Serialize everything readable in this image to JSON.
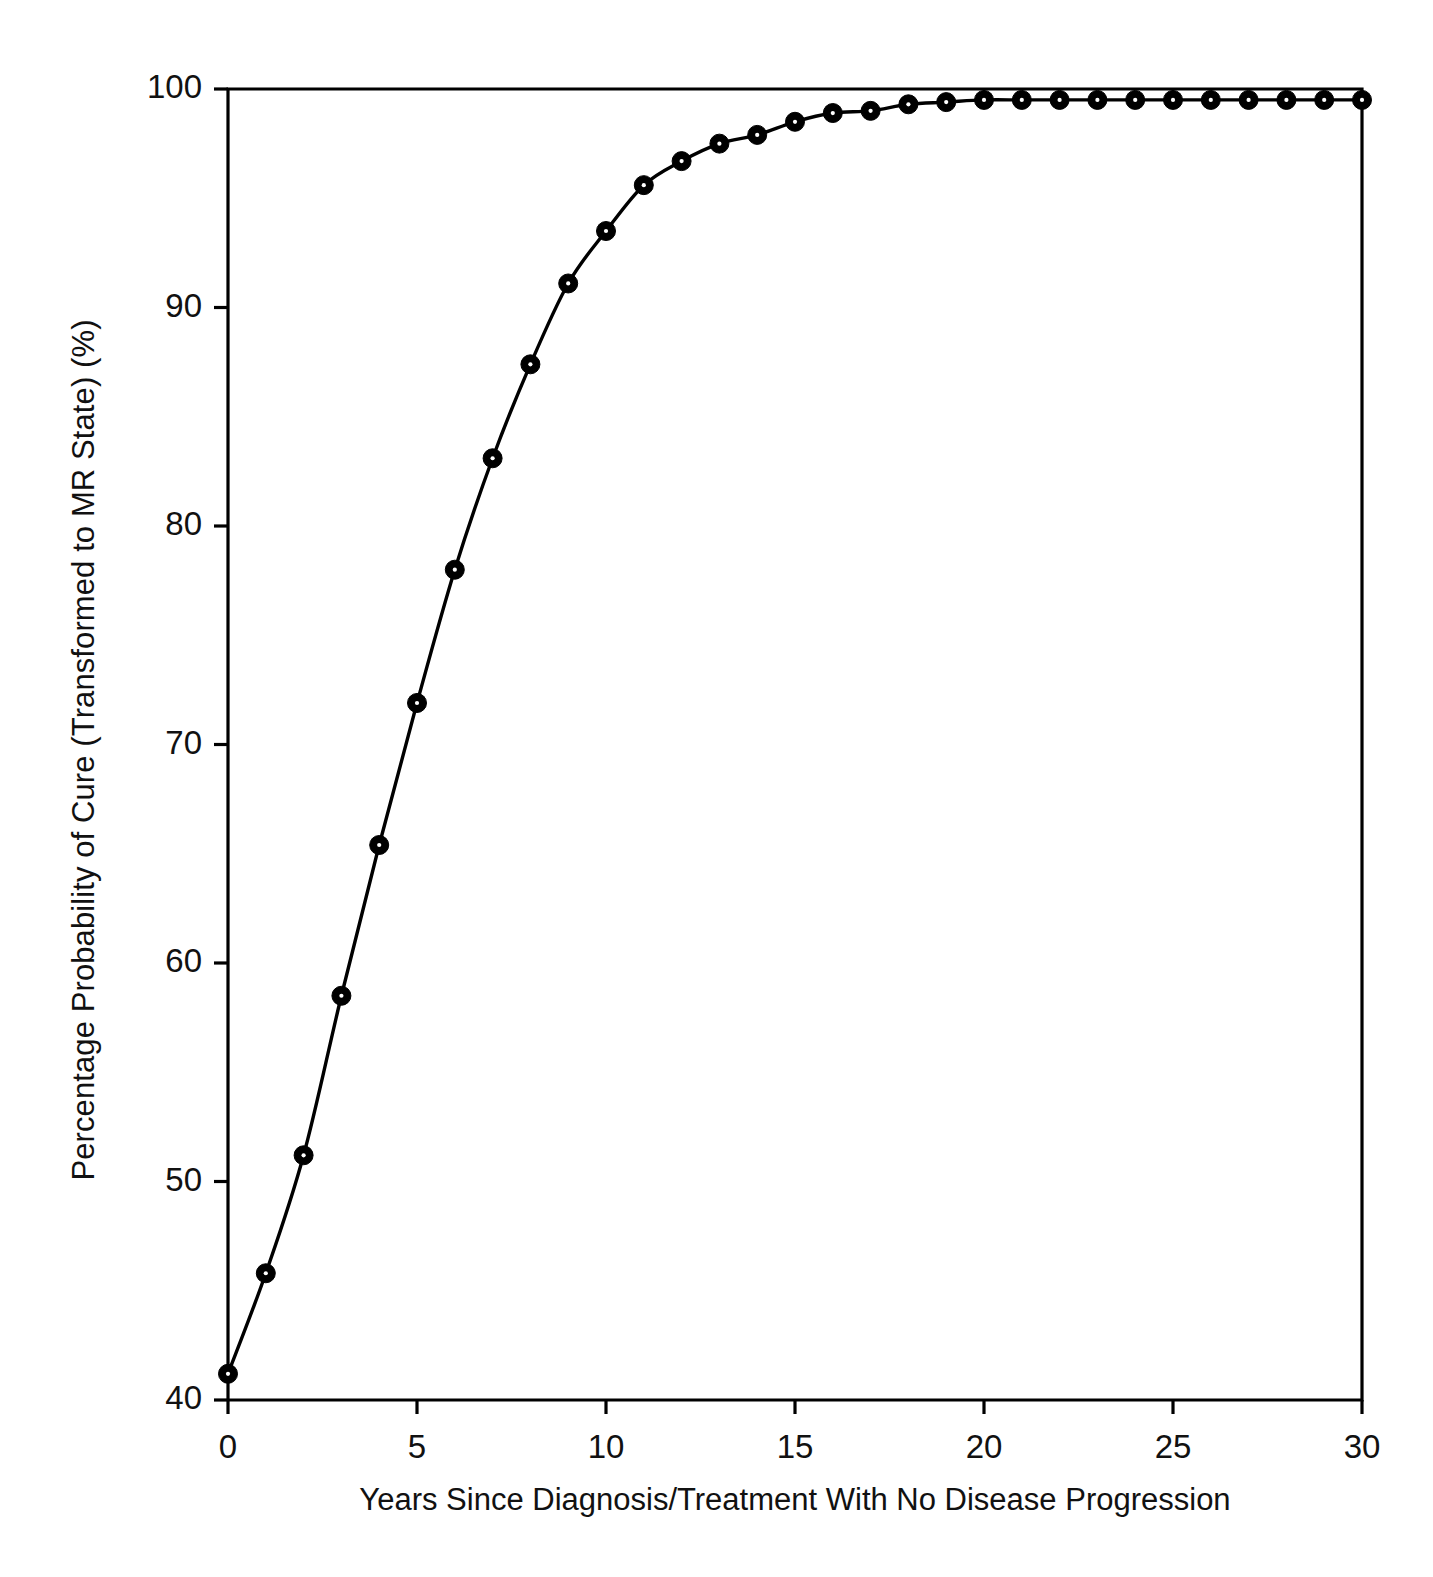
{
  "chart_data": {
    "type": "line",
    "title": "",
    "subtitle": "",
    "xlabel": "Years Since Diagnosis/Treatment With No Disease Progression",
    "ylabel": "Percentage Probability of Cure (Transformed to MR State) (%)",
    "xlim": [
      0,
      30
    ],
    "ylim": [
      40,
      100
    ],
    "xticks": [
      0,
      5,
      10,
      15,
      20,
      25,
      30
    ],
    "yticks": [
      40,
      50,
      60,
      70,
      80,
      90,
      100
    ],
    "xtick_labels": [
      "0",
      "5",
      "10",
      "15",
      "20",
      "25",
      "30"
    ],
    "ytick_labels": [
      "40",
      "50",
      "60",
      "70",
      "80",
      "90",
      "100"
    ],
    "grid": false,
    "legend": false,
    "legend_position": "none",
    "marker": "filled-circle",
    "line_color": "#000000",
    "marker_color": "#000000",
    "background_color": "#ffffff",
    "x": [
      0,
      1,
      2,
      3,
      4,
      5,
      6,
      7,
      8,
      9,
      10,
      11,
      12,
      13,
      14,
      15,
      16,
      17,
      18,
      19,
      20,
      21,
      22,
      23,
      24,
      25,
      26,
      27,
      28,
      29,
      30
    ],
    "values": [
      41.2,
      45.8,
      51.2,
      58.5,
      65.4,
      71.9,
      78.0,
      83.1,
      87.4,
      91.1,
      93.5,
      95.6,
      96.7,
      97.5,
      97.9,
      98.5,
      98.9,
      99.0,
      99.3,
      99.4,
      99.5,
      99.5,
      99.5,
      99.5,
      99.5,
      99.5,
      99.5,
      99.5,
      99.5,
      99.5,
      99.5
    ],
    "series": [
      {
        "name": "Percentage Probability of Cure",
        "values": [
          41.2,
          45.8,
          51.2,
          58.5,
          65.4,
          71.9,
          78.0,
          83.1,
          87.4,
          91.1,
          93.5,
          95.6,
          96.7,
          97.5,
          97.9,
          98.5,
          98.9,
          99.0,
          99.3,
          99.4,
          99.5,
          99.5,
          99.5,
          99.5,
          99.5,
          99.5,
          99.5,
          99.5,
          99.5,
          99.5,
          99.5
        ]
      }
    ],
    "annotations": []
  }
}
